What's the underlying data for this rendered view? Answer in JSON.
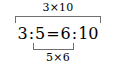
{
  "figure": {
    "type": "proportion-cross-multiplication-diagram",
    "background_color": "#ffffff",
    "text_color": "#000000",
    "bracket_color": "#6f6f6f",
    "top_label": "3×10",
    "bottom_label": "5×6",
    "equation": {
      "full_text": "3 : 5 = 6 : 10",
      "left_ratio_antecedent": "3",
      "ratio_colon_left": ":",
      "left_ratio_consequent": "5",
      "equals_sign": "=",
      "right_ratio_antecedent": "6",
      "ratio_colon_right": ":",
      "right_ratio_consequent": "10"
    },
    "brackets": {
      "outer_label": "3×10",
      "inner_label": "5×6"
    }
  }
}
